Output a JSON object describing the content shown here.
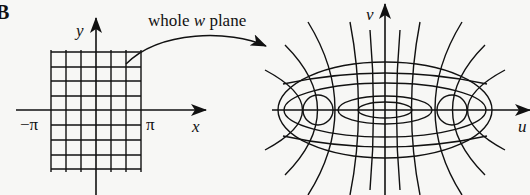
{
  "figure": {
    "panel_label": "B",
    "left_plot": {
      "x_axis_label": "x",
      "y_axis_label": "y",
      "tick_left": "−π",
      "tick_right": "π",
      "grid": {
        "vertical_lines": 7,
        "horizontal_lines": 9,
        "x_range": [
          "-π",
          "π"
        ]
      }
    },
    "mapping_arrow_label": {
      "prefix": "whole ",
      "variable": "w",
      "suffix": " plane"
    },
    "right_plot": {
      "u_axis_label": "u",
      "v_axis_label": "v",
      "curves": "confocal ellipses and hyperbolas"
    }
  }
}
